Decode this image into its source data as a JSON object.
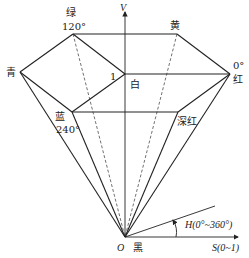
{
  "axes": {
    "v_label": "V",
    "s_label": "S(0~1)",
    "h_label": "H(0°~360°)",
    "origin_label": "O"
  },
  "vertices": {
    "green": {
      "name": "绿",
      "angle": "120°"
    },
    "yellow": {
      "name": "黄"
    },
    "cyan": {
      "name": "青"
    },
    "red": {
      "name": "红",
      "angle": "0°"
    },
    "white": {
      "name": "白",
      "value": "1"
    },
    "blue": {
      "name": "蓝",
      "angle": "240°"
    },
    "deep_red": {
      "name": "深红"
    },
    "black": {
      "name": "黑"
    }
  }
}
